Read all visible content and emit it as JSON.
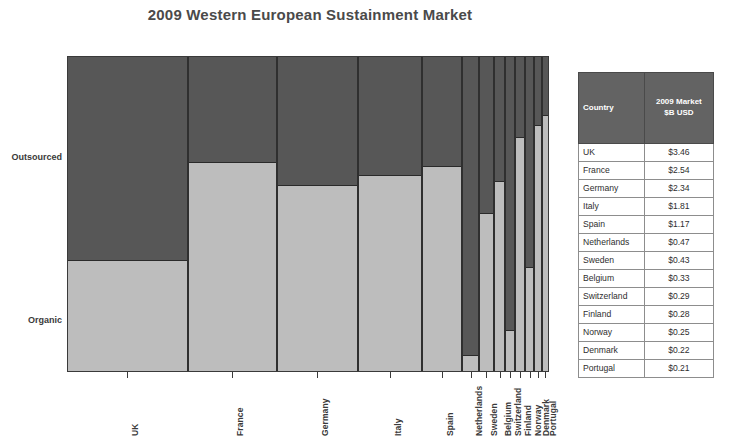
{
  "chart_title": "2009 Western European Sustainment Market",
  "axis": {
    "y_top_label": "Outsourced",
    "y_bottom_label": "Organic"
  },
  "table": {
    "headers": [
      "Country",
      "2009 Market $B USD"
    ],
    "header_country": "Country",
    "header_market_line1": "2009 Market",
    "header_market_line2": "$B USD",
    "rows": [
      {
        "country": "UK",
        "value": "$3.46"
      },
      {
        "country": "France",
        "value": "$2.54"
      },
      {
        "country": "Germany",
        "value": "$2.34"
      },
      {
        "country": "Italy",
        "value": "$1.81"
      },
      {
        "country": "Spain",
        "value": "$1.17"
      },
      {
        "country": "Netherlands",
        "value": "$0.47"
      },
      {
        "country": "Sweden",
        "value": "$0.43"
      },
      {
        "country": "Belgium",
        "value": "$0.33"
      },
      {
        "country": "Switzerland",
        "value": "$0.29"
      },
      {
        "country": "Finland",
        "value": "$0.28"
      },
      {
        "country": "Norway",
        "value": "$0.25"
      },
      {
        "country": "Denmark",
        "value": "$0.22"
      },
      {
        "country": "Portugal",
        "value": "$0.21"
      }
    ]
  },
  "colors": {
    "outsourced": "#575757",
    "organic": "#bdbdbd",
    "table_header_bg": "#636363",
    "text": "#3a3a3a"
  },
  "chart_data": {
    "type": "bar",
    "subtype": "marimekko",
    "title": "2009 Western European Sustainment Market",
    "xlabel": "",
    "ylabel": "",
    "grid": false,
    "legend": "y-axis labels",
    "width_metric": "2009 Market $B USD",
    "height_metric": "Share of market (Outsourced vs Organic), 0-100%",
    "ylim": [
      0,
      100
    ],
    "categories": [
      "UK",
      "France",
      "Germany",
      "Italy",
      "Spain",
      "Netherlands",
      "Sweden",
      "Belgium",
      "Switzerland",
      "Finland",
      "Norway",
      "Denmark",
      "Portugal"
    ],
    "widths": [
      3.46,
      2.54,
      2.34,
      1.81,
      1.17,
      0.47,
      0.43,
      0.33,
      0.29,
      0.28,
      0.25,
      0.22,
      0.21
    ],
    "series": [
      {
        "name": "Outsourced",
        "color": "#575757",
        "values": [
          65,
          34,
          41,
          38,
          35,
          95,
          50,
          40,
          87,
          26,
          67,
          22,
          19
        ]
      },
      {
        "name": "Organic",
        "color": "#bdbdbd",
        "values": [
          35,
          66,
          59,
          62,
          65,
          5,
          50,
          60,
          13,
          74,
          33,
          78,
          81
        ]
      }
    ]
  }
}
